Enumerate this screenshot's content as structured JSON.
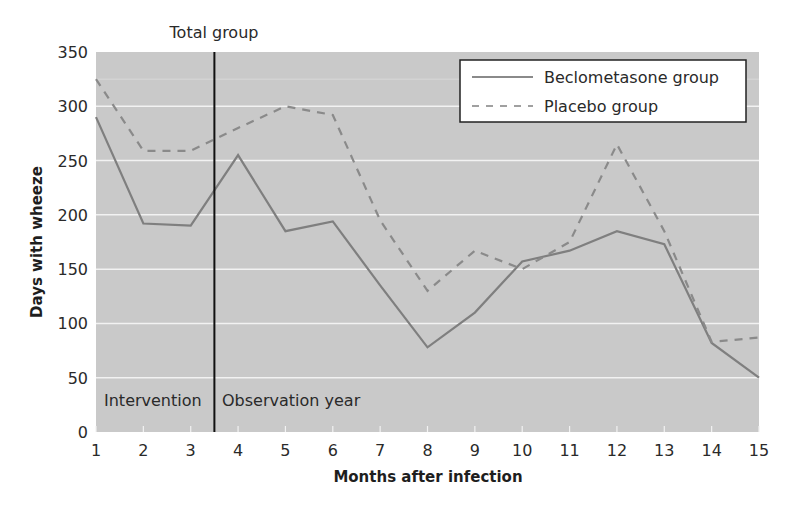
{
  "chart_data": {
    "type": "line",
    "title": "Total group",
    "xlabel": "Months after infection",
    "ylabel": "Days with wheeze",
    "x": [
      1,
      2,
      3,
      4,
      5,
      6,
      7,
      8,
      9,
      10,
      11,
      12,
      13,
      14,
      15
    ],
    "xlim": [
      1,
      15
    ],
    "ylim": [
      0,
      350
    ],
    "yticks": [
      0,
      50,
      100,
      150,
      200,
      250,
      300,
      350
    ],
    "xticks": [
      1,
      2,
      3,
      4,
      5,
      6,
      7,
      8,
      9,
      10,
      11,
      12,
      13,
      14,
      15
    ],
    "grid": true,
    "legend_position": "upper right",
    "series": [
      {
        "name": "Beclometasone group",
        "style": "solid",
        "color": "#7f7f7f",
        "values": [
          290,
          192,
          190,
          255,
          185,
          194,
          135,
          78,
          110,
          157,
          167,
          185,
          173,
          82,
          50
        ]
      },
      {
        "name": "Placebo group",
        "style": "dashed",
        "color": "#8a8a8a",
        "values": [
          325,
          259,
          259,
          280,
          300,
          292,
          195,
          130,
          167,
          150,
          175,
          265,
          185,
          83,
          87
        ]
      }
    ],
    "annotations": [
      {
        "text": "Intervention",
        "x": 1.1,
        "y": 30
      },
      {
        "text": "Observation year",
        "x": 3.6,
        "y": 30
      },
      {
        "type": "vline",
        "x": 3.5,
        "color": "#111111"
      }
    ]
  },
  "labels": {
    "title": "Total group",
    "xlabel": "Months after infection",
    "ylabel": "Days with wheeze",
    "intervention": "Intervention",
    "observation": "Observation year",
    "legend_beclo": "Beclometasone group",
    "legend_placebo": "Placebo group"
  },
  "colors": {
    "plot_bg": "#c9c9c9",
    "grid": "#f2f2f2",
    "line": "#7f7f7f",
    "vline": "#111111"
  }
}
